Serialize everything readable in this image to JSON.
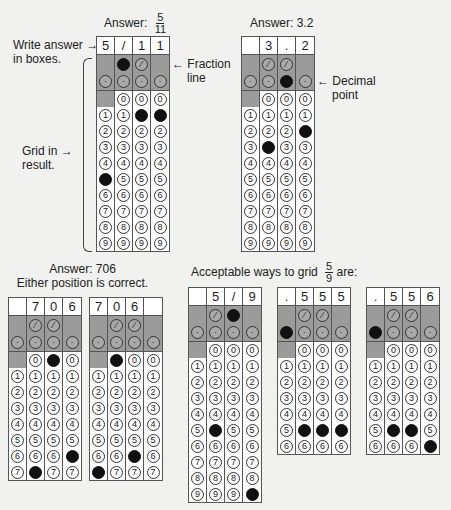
{
  "annotations": {
    "write_answer": [
      "Write answer",
      "in boxes."
    ],
    "fraction_line": [
      "Fraction",
      "line"
    ],
    "grid_in": [
      "Grid in",
      "result."
    ],
    "decimal_point": [
      "Decimal",
      "point"
    ]
  },
  "titles": {
    "g1_prefix": "Answer:",
    "g1_num": "5",
    "g1_den": "11",
    "g2": "Answer: 3.2",
    "g34_line1": "Answer: 706",
    "g34_line2": "Either position is correct.",
    "g567_prefix": "Acceptable ways to grid",
    "g567_num": "5",
    "g567_den": "9",
    "g567_suffix": "are:"
  },
  "grids": [
    {
      "id": "g1",
      "x": 96,
      "y": 36,
      "boxes": [
        "5",
        "/",
        "1",
        "1"
      ],
      "slash": [
        false,
        true,
        false,
        false
      ],
      "dot": [
        false,
        false,
        false,
        false
      ],
      "digits": [
        5,
        null,
        1,
        1
      ],
      "rows": 10
    },
    {
      "id": "g2",
      "x": 241,
      "y": 36,
      "boxes": [
        "",
        "3",
        ".",
        "2"
      ],
      "slash": [
        false,
        false,
        false,
        false
      ],
      "dot": [
        false,
        false,
        true,
        false
      ],
      "digits": [
        null,
        3,
        null,
        2
      ],
      "rows": 10
    },
    {
      "id": "g3",
      "x": 8,
      "y": 297,
      "boxes": [
        "",
        "7",
        "0",
        "6"
      ],
      "slash": [
        false,
        false,
        false,
        false
      ],
      "dot": [
        false,
        false,
        false,
        false
      ],
      "digits": [
        null,
        7,
        0,
        6
      ],
      "rows": 8
    },
    {
      "id": "g4",
      "x": 89,
      "y": 297,
      "boxes": [
        "7",
        "0",
        "6",
        ""
      ],
      "slash": [
        false,
        false,
        false,
        false
      ],
      "dot": [
        false,
        false,
        false,
        false
      ],
      "digits": [
        7,
        0,
        6,
        null
      ],
      "rows": 8
    },
    {
      "id": "g5",
      "x": 188,
      "y": 287,
      "boxes": [
        "",
        "5",
        "/",
        "9"
      ],
      "slash": [
        false,
        false,
        true,
        false
      ],
      "dot": [
        false,
        false,
        false,
        false
      ],
      "digits": [
        null,
        5,
        null,
        9
      ],
      "rows": 10
    },
    {
      "id": "g6",
      "x": 277,
      "y": 287,
      "boxes": [
        ".",
        "5",
        "5",
        "5"
      ],
      "slash": [
        false,
        false,
        false,
        false
      ],
      "dot": [
        true,
        false,
        false,
        false
      ],
      "digits": [
        null,
        5,
        5,
        5
      ],
      "rows": 7
    },
    {
      "id": "g7",
      "x": 366,
      "y": 287,
      "boxes": [
        ".",
        "5",
        "5",
        "6"
      ],
      "slash": [
        false,
        false,
        false,
        false
      ],
      "dot": [
        true,
        false,
        false,
        false
      ],
      "digits": [
        null,
        5,
        5,
        6
      ],
      "rows": 7
    }
  ]
}
